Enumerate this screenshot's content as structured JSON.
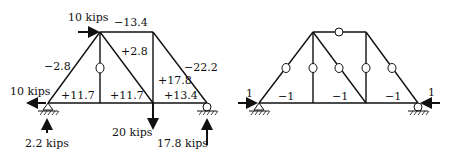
{
  "left_truss": {
    "title": "Actual member forces",
    "nodes": {
      "A": [
        48,
        103
      ],
      "B": [
        100,
        103
      ],
      "C": [
        153,
        103
      ],
      "D": [
        207,
        103
      ],
      "E": [
        100,
        32
      ],
      "F": [
        153,
        32
      ]
    },
    "members": [
      {
        "id": "AB",
        "label": "+11.7"
      },
      {
        "id": "BC",
        "label": "+11.7"
      },
      {
        "id": "CD",
        "label": "+13.4"
      },
      {
        "id": "EF",
        "label": "−13.4"
      },
      {
        "id": "AE",
        "label": "−2.8"
      },
      {
        "id": "EC",
        "label": "+2.8"
      },
      {
        "id": "FC",
        "label": "+17.8"
      },
      {
        "id": "FD",
        "label": "−22.2"
      },
      {
        "id": "EB",
        "label": "0"
      }
    ],
    "loads": {
      "top_horizontal": "10 kips",
      "left_horizontal": "10 kips",
      "left_reaction": "2.2 kips",
      "mid_vertical": "20 kips",
      "right_reaction": "17.8 kips"
    }
  },
  "right_truss": {
    "title": "Unit load member forces",
    "members": [
      {
        "id": "AB",
        "label": "−1"
      },
      {
        "id": "BC",
        "label": "−1"
      },
      {
        "id": "CD",
        "label": "−1"
      },
      {
        "id": "EF",
        "label": "0"
      },
      {
        "id": "AE",
        "label": "0"
      },
      {
        "id": "EB",
        "label": "0"
      },
      {
        "id": "EC",
        "label": "0"
      },
      {
        "id": "FC",
        "label": "0"
      },
      {
        "id": "FD",
        "label": "0"
      }
    ],
    "loads": {
      "left_unit": "1",
      "right_unit": "1"
    }
  }
}
